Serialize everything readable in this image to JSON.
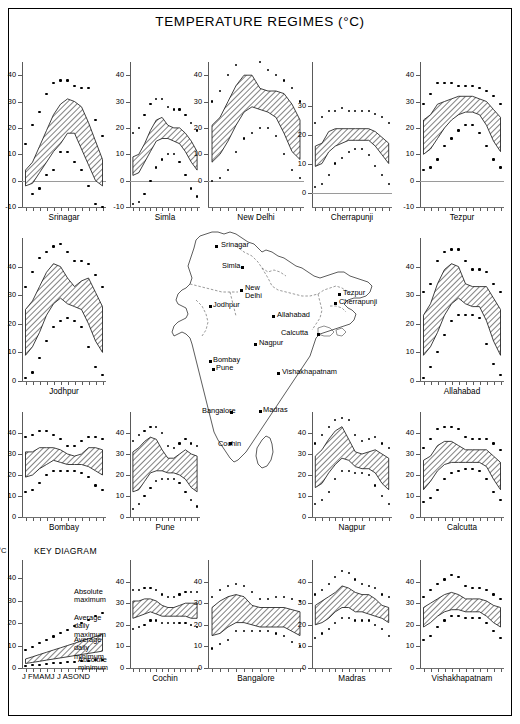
{
  "figure": {
    "title": "TEMPERATURE REGIMES  (°C)",
    "unit_label": "°C",
    "month_axis": "J FMAMJ J ASOND"
  },
  "key_diagram": {
    "heading": "KEY DIAGRAM",
    "labels": [
      {
        "id": "absolute-maximum",
        "text": "Absolute\nmaximum"
      },
      {
        "id": "average-daily-maximum",
        "text": "Average daily\nmaximum"
      },
      {
        "id": "average-daily-minimum",
        "text": "Average daily\nminimum"
      },
      {
        "id": "absolute-minimum",
        "text": "Absolute\nminimum"
      }
    ],
    "y_ticks": [
      0,
      10,
      20,
      30,
      40
    ],
    "unit": "°C"
  },
  "map": {
    "name": "india-station-map",
    "cities": [
      {
        "name": "Srinagar",
        "x": 215,
        "y": 245,
        "lx": 221,
        "ly": 241
      },
      {
        "name": "Simla",
        "x": 241,
        "y": 266,
        "lx": 222,
        "ly": 262
      },
      {
        "name": "New",
        "x": 240,
        "y": 289,
        "lx": 245,
        "ly": 284
      },
      {
        "name": "Delhi",
        "x": -1,
        "y": -1,
        "lx": 245,
        "ly": 292
      },
      {
        "name": "Jodhpur",
        "x": 209,
        "y": 305,
        "lx": 213,
        "ly": 301
      },
      {
        "name": "Allahabad",
        "x": 272,
        "y": 315,
        "lx": 277,
        "ly": 311
      },
      {
        "name": "Calcutta",
        "x": 317,
        "y": 333,
        "lx": 281,
        "ly": 329
      },
      {
        "name": "Nagpur",
        "x": 254,
        "y": 343,
        "lx": 259,
        "ly": 339
      },
      {
        "name": "Tezpur",
        "x": 338,
        "y": 293,
        "lx": 343,
        "ly": 289
      },
      {
        "name": "Cherrapunji",
        "x": 334,
        "y": 302,
        "lx": 339,
        "ly": 298
      },
      {
        "name": "Bombay",
        "x": 209,
        "y": 360,
        "lx": 213,
        "ly": 356
      },
      {
        "name": "Pune",
        "x": 212,
        "y": 368,
        "lx": 216,
        "ly": 364
      },
      {
        "name": "Vishakhapatnam",
        "x": 277,
        "y": 372,
        "lx": 282,
        "ly": 368
      },
      {
        "name": "Bangalore",
        "x": 230,
        "y": 411,
        "lx": 202,
        "ly": 407
      },
      {
        "name": "Madras",
        "x": 259,
        "y": 410,
        "lx": 263,
        "ly": 406
      },
      {
        "name": "Cochin",
        "x": 229,
        "y": 442,
        "lx": 218,
        "ly": 440
      }
    ]
  },
  "chart_data": {
    "type": "area",
    "title": "TEMPERATURE REGIMES  (°C)",
    "xlabel": "",
    "ylabel": "°C",
    "categories": [
      "J",
      "F",
      "M",
      "A",
      "M",
      "J",
      "J",
      "A",
      "S",
      "O",
      "N",
      "D"
    ],
    "series_names": [
      "Absolute maximum",
      "Average daily maximum",
      "Average daily minimum",
      "Absolute minimum"
    ],
    "panels": [
      {
        "station": "Srinagar",
        "row": 1,
        "col": 1,
        "ylim": [
          -10,
          45
        ],
        "yticks": [
          -10,
          0,
          10,
          20,
          30,
          40
        ],
        "avg_max": [
          4,
          7,
          13,
          19,
          25,
          29,
          31,
          30,
          28,
          22,
          15,
          8
        ],
        "avg_min": [
          -2,
          -1,
          3,
          7,
          11,
          14,
          18,
          18,
          12,
          6,
          0,
          -2
        ],
        "abs_max": [
          14,
          21,
          26,
          33,
          37,
          38,
          38,
          36,
          35,
          35,
          23,
          17
        ],
        "abs_min": [
          -11,
          -5,
          -3,
          2,
          4,
          11,
          11,
          7,
          4,
          -2,
          -9,
          -10
        ]
      },
      {
        "station": "Simla",
        "row": 1,
        "col": 2,
        "ylim": [
          -10,
          45
        ],
        "yticks": [
          -10,
          0,
          10,
          20,
          30,
          40
        ],
        "avg_max": [
          9,
          10,
          14,
          19,
          23,
          24,
          21,
          20,
          20,
          18,
          15,
          11
        ],
        "avg_min": [
          2,
          3,
          7,
          11,
          15,
          16,
          16,
          15,
          14,
          11,
          7,
          4
        ],
        "abs_max": [
          18,
          20,
          25,
          29,
          31,
          31,
          28,
          27,
          27,
          25,
          22,
          19
        ],
        "abs_min": [
          -9,
          -8,
          -5,
          0,
          5,
          8,
          10,
          10,
          7,
          2,
          -3,
          -6
        ]
      },
      {
        "station": "New Delhi",
        "row": 1,
        "col": 3,
        "ylim": [
          -10,
          45
        ],
        "yticks": [
          0,
          10,
          20,
          30,
          40
        ],
        "avg_max": [
          21,
          24,
          30,
          36,
          40,
          40,
          35,
          34,
          34,
          33,
          29,
          23
        ],
        "avg_min": [
          7,
          10,
          15,
          21,
          26,
          28,
          27,
          26,
          24,
          18,
          11,
          8
        ],
        "abs_max": [
          30,
          34,
          40,
          44,
          46,
          47,
          45,
          42,
          40,
          38,
          35,
          30
        ],
        "abs_min": [
          0,
          1,
          4,
          11,
          16,
          18,
          20,
          20,
          17,
          10,
          4,
          1
        ]
      },
      {
        "station": "Cherrapunji",
        "row": 1,
        "col": 4,
        "ylim": [
          -5,
          45
        ],
        "yticks": [
          0,
          10,
          20,
          30
        ],
        "avg_max": [
          16,
          17,
          21,
          22,
          22,
          22,
          22,
          22,
          22,
          21,
          19,
          17
        ],
        "avg_min": [
          9,
          10,
          14,
          16,
          17,
          18,
          18,
          18,
          18,
          16,
          13,
          10
        ],
        "abs_max": [
          24,
          26,
          28,
          28,
          29,
          28,
          28,
          28,
          28,
          27,
          26,
          24
        ],
        "abs_min": [
          2,
          3,
          6,
          10,
          12,
          14,
          15,
          15,
          13,
          9,
          6,
          3
        ]
      },
      {
        "station": "Tezpur",
        "row": 1,
        "col": 5,
        "ylim": [
          -10,
          45
        ],
        "yticks": [
          -10,
          0,
          10,
          20,
          30,
          40
        ],
        "avg_max": [
          23,
          25,
          29,
          30,
          31,
          32,
          32,
          32,
          31,
          30,
          27,
          24
        ],
        "avg_min": [
          10,
          12,
          16,
          20,
          23,
          25,
          26,
          26,
          25,
          21,
          15,
          11
        ],
        "abs_max": [
          29,
          33,
          37,
          37,
          37,
          36,
          36,
          36,
          35,
          34,
          32,
          29
        ],
        "abs_min": [
          4,
          5,
          8,
          13,
          16,
          19,
          21,
          21,
          18,
          13,
          8,
          5
        ]
      },
      {
        "station": "Jodhpur",
        "row": 2,
        "col": 1,
        "ylim": [
          0,
          50
        ],
        "yticks": [
          0,
          10,
          20,
          30,
          40
        ],
        "avg_max": [
          25,
          28,
          33,
          38,
          41,
          40,
          36,
          33,
          35,
          36,
          31,
          26
        ],
        "avg_min": [
          9,
          12,
          17,
          23,
          27,
          29,
          27,
          26,
          25,
          20,
          14,
          10
        ],
        "abs_max": [
          33,
          38,
          43,
          45,
          47,
          48,
          45,
          42,
          42,
          41,
          37,
          33
        ],
        "abs_min": [
          1,
          3,
          8,
          14,
          19,
          21,
          22,
          21,
          19,
          12,
          5,
          2
        ]
      },
      {
        "station": "Allahabad",
        "row": 2,
        "col": 5,
        "ylim": [
          0,
          50
        ],
        "yticks": [
          0,
          10,
          20,
          30,
          40
        ],
        "avg_max": [
          23,
          27,
          34,
          39,
          41,
          40,
          34,
          33,
          33,
          33,
          29,
          25
        ],
        "avg_min": [
          9,
          12,
          17,
          23,
          27,
          29,
          27,
          26,
          26,
          21,
          14,
          9
        ],
        "abs_max": [
          31,
          34,
          42,
          45,
          46,
          46,
          42,
          39,
          39,
          38,
          34,
          31
        ],
        "abs_min": [
          1,
          5,
          10,
          16,
          21,
          23,
          23,
          23,
          22,
          13,
          6,
          2
        ]
      },
      {
        "station": "Bombay",
        "row": 3,
        "col": 1,
        "ylim": [
          0,
          50
        ],
        "yticks": [
          0,
          10,
          20,
          30,
          40
        ],
        "avg_max": [
          31,
          31,
          33,
          33,
          33,
          32,
          30,
          29,
          30,
          33,
          33,
          32
        ],
        "avg_min": [
          19,
          20,
          23,
          25,
          27,
          26,
          25,
          25,
          25,
          24,
          22,
          20
        ],
        "abs_max": [
          38,
          39,
          41,
          41,
          39,
          37,
          34,
          34,
          36,
          38,
          38,
          37
        ],
        "abs_min": [
          12,
          13,
          16,
          20,
          22,
          22,
          22,
          22,
          21,
          19,
          15,
          13
        ]
      },
      {
        "station": "Pune",
        "row": 3,
        "col": 2,
        "ylim": [
          0,
          50
        ],
        "yticks": [
          0,
          10,
          20,
          30,
          40
        ],
        "avg_max": [
          31,
          33,
          36,
          38,
          37,
          32,
          28,
          28,
          30,
          32,
          30,
          29
        ],
        "avg_min": [
          12,
          13,
          17,
          21,
          22,
          22,
          21,
          21,
          20,
          18,
          14,
          12
        ],
        "abs_max": [
          36,
          39,
          41,
          43,
          43,
          40,
          34,
          33,
          35,
          37,
          35,
          34
        ],
        "abs_min": [
          4,
          6,
          10,
          14,
          17,
          18,
          18,
          18,
          16,
          12,
          8,
          5
        ]
      },
      {
        "station": "Nagpur",
        "row": 3,
        "col": 4,
        "ylim": [
          0,
          50
        ],
        "yticks": [
          0,
          10,
          20,
          30,
          40
        ],
        "avg_max": [
          29,
          32,
          37,
          41,
          43,
          37,
          31,
          30,
          31,
          32,
          30,
          28
        ],
        "avg_min": [
          14,
          16,
          21,
          25,
          28,
          27,
          24,
          23,
          23,
          21,
          16,
          13
        ],
        "abs_max": [
          35,
          39,
          43,
          46,
          47,
          46,
          39,
          36,
          37,
          38,
          35,
          33
        ],
        "abs_min": [
          6,
          8,
          12,
          18,
          22,
          22,
          21,
          21,
          20,
          15,
          10,
          6
        ]
      },
      {
        "station": "Calcutta",
        "row": 3,
        "col": 5,
        "ylim": [
          0,
          50
        ],
        "yticks": [
          0,
          10,
          20,
          30,
          40
        ],
        "avg_max": [
          27,
          29,
          34,
          36,
          36,
          34,
          32,
          32,
          32,
          32,
          29,
          26
        ],
        "avg_min": [
          13,
          17,
          22,
          25,
          26,
          26,
          26,
          26,
          26,
          24,
          18,
          13
        ],
        "abs_max": [
          33,
          37,
          42,
          43,
          43,
          42,
          38,
          37,
          37,
          37,
          35,
          32
        ],
        "abs_min": [
          7,
          9,
          13,
          18,
          21,
          22,
          23,
          23,
          22,
          18,
          12,
          8
        ]
      },
      {
        "station": "Cochin",
        "row": 4,
        "col": 2,
        "ylim": [
          0,
          50
        ],
        "yticks": [
          0,
          10,
          20,
          30,
          40
        ],
        "avg_max": [
          31,
          31,
          32,
          32,
          31,
          29,
          28,
          28,
          29,
          30,
          30,
          30
        ],
        "avg_min": [
          23,
          24,
          25,
          26,
          25,
          24,
          24,
          24,
          24,
          24,
          23,
          23
        ],
        "abs_max": [
          36,
          36,
          37,
          37,
          36,
          34,
          33,
          33,
          34,
          35,
          35,
          35
        ],
        "abs_min": [
          18,
          19,
          20,
          22,
          22,
          21,
          21,
          21,
          21,
          21,
          20,
          19
        ]
      },
      {
        "station": "Bangalore",
        "row": 4,
        "col": 3,
        "ylim": [
          0,
          50
        ],
        "yticks": [
          0,
          10,
          20,
          30,
          40
        ],
        "avg_max": [
          28,
          31,
          33,
          34,
          33,
          29,
          28,
          28,
          28,
          28,
          27,
          26
        ],
        "avg_min": [
          15,
          16,
          19,
          21,
          21,
          20,
          19,
          19,
          19,
          19,
          17,
          15
        ],
        "abs_max": [
          33,
          36,
          38,
          39,
          38,
          35,
          32,
          32,
          33,
          33,
          32,
          31
        ],
        "abs_min": [
          9,
          11,
          13,
          17,
          17,
          17,
          17,
          17,
          16,
          15,
          12,
          10
        ]
      },
      {
        "station": "Madras",
        "row": 4,
        "col": 4,
        "ylim": [
          0,
          50
        ],
        "yticks": [
          0,
          10,
          20,
          30,
          40
        ],
        "avg_max": [
          29,
          31,
          33,
          35,
          38,
          37,
          35,
          34,
          34,
          32,
          29,
          28
        ],
        "avg_min": [
          20,
          21,
          23,
          26,
          28,
          28,
          26,
          26,
          25,
          24,
          23,
          21
        ],
        "abs_max": [
          34,
          36,
          39,
          42,
          45,
          44,
          41,
          39,
          38,
          37,
          34,
          33
        ],
        "abs_min": [
          14,
          16,
          18,
          21,
          23,
          23,
          22,
          22,
          22,
          20,
          18,
          15
        ]
      },
      {
        "station": "Vishakhapatnam",
        "row": 4,
        "col": 5,
        "ylim": [
          0,
          50
        ],
        "yticks": [
          0,
          10,
          20,
          30,
          40
        ],
        "avg_max": [
          28,
          30,
          32,
          34,
          35,
          34,
          32,
          32,
          32,
          31,
          29,
          28
        ],
        "avg_min": [
          19,
          21,
          24,
          26,
          27,
          27,
          26,
          26,
          26,
          24,
          21,
          19
        ],
        "abs_max": [
          33,
          36,
          39,
          41,
          43,
          42,
          38,
          37,
          37,
          36,
          34,
          32
        ],
        "abs_min": [
          13,
          15,
          19,
          22,
          24,
          24,
          23,
          23,
          23,
          21,
          17,
          14
        ]
      }
    ]
  }
}
